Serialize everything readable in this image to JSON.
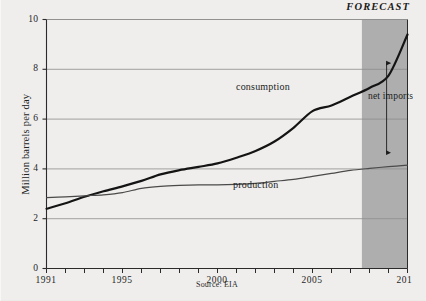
{
  "chart_data": {
    "type": "line",
    "title": "",
    "xlabel": "",
    "ylabel": "Million barrels per day",
    "xlim": [
      1991,
      2010
    ],
    "ylim": [
      0,
      10
    ],
    "grid": true,
    "legend": "inline-annotations",
    "source": "Source: EIA",
    "forecast_label": "FORECAST",
    "forecast_start": 2007.6,
    "annotation": "net imports",
    "ytick_labels": [
      "0",
      "2",
      "4",
      "6",
      "8",
      "10"
    ],
    "ytick_values": [
      0,
      2,
      4,
      6,
      8,
      10
    ],
    "xtick_values": [
      1991,
      1992,
      1993,
      1994,
      1995,
      1996,
      1997,
      1998,
      1999,
      2000,
      2001,
      2002,
      2003,
      2004,
      2005,
      2006,
      2007,
      2008,
      2009,
      2010
    ],
    "xtick_labels": [
      {
        "value": 1991,
        "label": "1991"
      },
      {
        "value": 1995,
        "label": "1995"
      },
      {
        "value": 2000,
        "label": "2000"
      },
      {
        "value": 2005,
        "label": "2005"
      },
      {
        "value": 2010,
        "label": "201"
      }
    ],
    "series": [
      {
        "name": "consumption",
        "color": "#141414",
        "width": 2.2,
        "x": [
          1991,
          1992,
          1993,
          1994,
          1995,
          1996,
          1997,
          1998,
          1999,
          2000,
          2001,
          2002,
          2003,
          2004,
          2005,
          2006,
          2007,
          2008,
          2009,
          2010
        ],
        "values": [
          2.4,
          2.62,
          2.88,
          3.1,
          3.3,
          3.52,
          3.78,
          3.95,
          4.08,
          4.22,
          4.45,
          4.72,
          5.1,
          5.65,
          6.32,
          6.55,
          6.9,
          7.25,
          7.75,
          9.4
        ]
      },
      {
        "name": "production",
        "color": "#4a4a4a",
        "width": 1.2,
        "x": [
          1991,
          1992,
          1993,
          1994,
          1995,
          1996,
          1997,
          1998,
          1999,
          2000,
          2001,
          2002,
          2003,
          2004,
          2005,
          2006,
          2007,
          2008,
          2009,
          2010
        ],
        "values": [
          2.85,
          2.88,
          2.92,
          2.96,
          3.05,
          3.22,
          3.3,
          3.34,
          3.36,
          3.36,
          3.38,
          3.42,
          3.5,
          3.58,
          3.7,
          3.82,
          3.94,
          4.02,
          4.09,
          4.15
        ]
      }
    ],
    "netimports_arrow": {
      "x": 2008.9,
      "y_top": 8.45,
      "y_bottom": 4.45
    }
  },
  "colors": {
    "background": "#efeeec",
    "forecast_band": "#a8a8a8",
    "axis": "#2b2b2b",
    "grid": "#8d8d8d",
    "consumption": "#141414",
    "production": "#4a4a4a"
  }
}
